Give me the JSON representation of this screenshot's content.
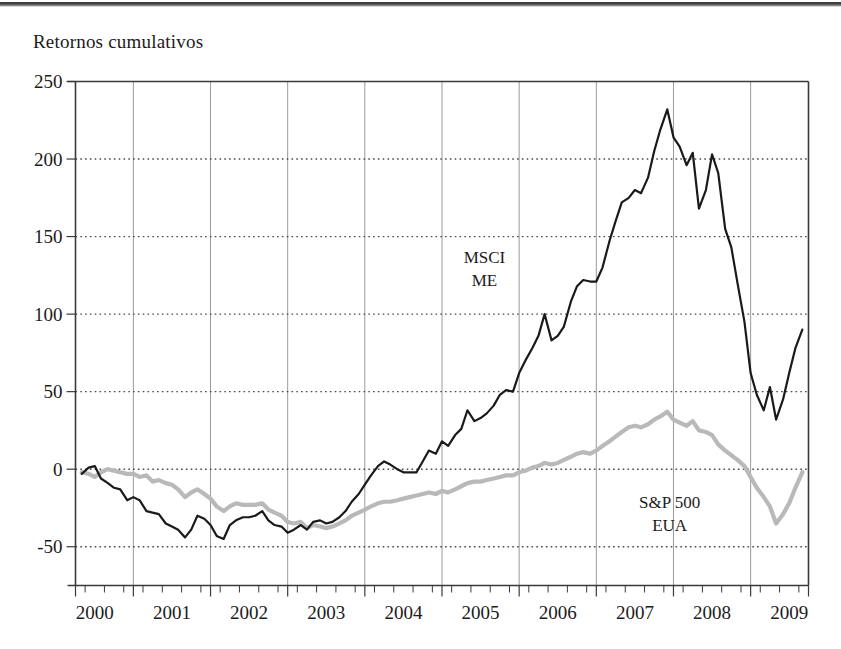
{
  "title": "Retornos cumulativos",
  "chart_data": {
    "type": "line",
    "title": "Retornos cumulativos",
    "xlabel": "",
    "ylabel": "",
    "ylim": [
      -75,
      250
    ],
    "xlim": [
      1999.75,
      2009.25
    ],
    "grid": "major vertical solid, horizontal dotted at y ticks",
    "legend_position": "inline annotations on plot",
    "y_ticks": [
      250,
      200,
      150,
      100,
      50,
      0,
      -50
    ],
    "x_ticks": [
      2000,
      2001,
      2002,
      2003,
      2004,
      2005,
      2006,
      2007,
      2008,
      2009
    ],
    "x_minor_ticks_per_year": 4,
    "annotations": [
      {
        "text_line1": "MSCI",
        "text_line2": "ME",
        "x": 2005.05,
        "y": 133
      },
      {
        "text_line1": "S&P 500",
        "text_line2": "EUA",
        "x": 2007.45,
        "y": -25
      }
    ],
    "series": [
      {
        "name": "MSCI ME",
        "color": "#1a1a1a",
        "width": 2.2,
        "x": [
          1999.83,
          1999.92,
          2000.0,
          2000.08,
          2000.17,
          2000.25,
          2000.33,
          2000.42,
          2000.5,
          2000.58,
          2000.67,
          2000.75,
          2000.83,
          2000.92,
          2001.0,
          2001.08,
          2001.17,
          2001.25,
          2001.33,
          2001.42,
          2001.5,
          2001.58,
          2001.67,
          2001.75,
          2001.83,
          2001.92,
          2002.0,
          2002.08,
          2002.17,
          2002.25,
          2002.33,
          2002.42,
          2002.5,
          2002.58,
          2002.67,
          2002.75,
          2002.83,
          2002.92,
          2003.0,
          2003.08,
          2003.17,
          2003.25,
          2003.33,
          2003.42,
          2003.5,
          2003.58,
          2003.67,
          2003.75,
          2003.83,
          2003.92,
          2004.0,
          2004.08,
          2004.17,
          2004.25,
          2004.33,
          2004.42,
          2004.5,
          2004.58,
          2004.67,
          2004.75,
          2004.83,
          2004.92,
          2005.0,
          2005.08,
          2005.17,
          2005.25,
          2005.33,
          2005.42,
          2005.5,
          2005.58,
          2005.67,
          2005.75,
          2005.83,
          2005.92,
          2006.0,
          2006.08,
          2006.17,
          2006.25,
          2006.33,
          2006.42,
          2006.5,
          2006.58,
          2006.67,
          2006.75,
          2006.83,
          2006.92,
          2007.0,
          2007.08,
          2007.17,
          2007.25,
          2007.33,
          2007.42,
          2007.5,
          2007.58,
          2007.67,
          2007.75,
          2007.83,
          2007.92,
          2008.0,
          2008.08,
          2008.17,
          2008.25,
          2008.33,
          2008.42,
          2008.5,
          2008.58,
          2008.67,
          2008.75,
          2008.83,
          2008.92,
          2009.0,
          2009.08,
          2009.17
        ],
        "y": [
          -3,
          1,
          2,
          -6,
          -9,
          -12,
          -13,
          -20,
          -18,
          -20,
          -27,
          -28,
          -29,
          -35,
          -37,
          -39,
          -44,
          -39,
          -30,
          -32,
          -36,
          -43,
          -45,
          -36,
          -33,
          -31,
          -31,
          -30,
          -27,
          -33,
          -36,
          -37,
          -41,
          -39,
          -36,
          -39,
          -34,
          -33,
          -35,
          -34,
          -31,
          -27,
          -21,
          -16,
          -10,
          -4,
          2,
          5,
          3,
          0,
          -2,
          -2,
          -2,
          5,
          12,
          10,
          18,
          15,
          22,
          26,
          38,
          31,
          33,
          36,
          41,
          48,
          51,
          50,
          62,
          70,
          78,
          86,
          100,
          83,
          86,
          92,
          108,
          118,
          122,
          121,
          121,
          130,
          147,
          160,
          172,
          175,
          180,
          178,
          188,
          205,
          219,
          232,
          214,
          208,
          196,
          204,
          168,
          180,
          203,
          191,
          155,
          143,
          120,
          95,
          62,
          48,
          38,
          53,
          32,
          45,
          62,
          78,
          90
        ]
      },
      {
        "name": "S&P 500 EUA",
        "color": "#b9b9b9",
        "width": 4.2,
        "x": [
          1999.83,
          1999.92,
          2000.0,
          2000.08,
          2000.17,
          2000.25,
          2000.33,
          2000.42,
          2000.5,
          2000.58,
          2000.67,
          2000.75,
          2000.83,
          2000.92,
          2001.0,
          2001.08,
          2001.17,
          2001.25,
          2001.33,
          2001.42,
          2001.5,
          2001.58,
          2001.67,
          2001.75,
          2001.83,
          2001.92,
          2002.0,
          2002.08,
          2002.17,
          2002.25,
          2002.33,
          2002.42,
          2002.5,
          2002.58,
          2002.67,
          2002.75,
          2002.83,
          2002.92,
          2003.0,
          2003.08,
          2003.17,
          2003.25,
          2003.33,
          2003.42,
          2003.5,
          2003.58,
          2003.67,
          2003.75,
          2003.83,
          2003.92,
          2004.0,
          2004.08,
          2004.17,
          2004.25,
          2004.33,
          2004.42,
          2004.5,
          2004.58,
          2004.67,
          2004.75,
          2004.83,
          2004.92,
          2005.0,
          2005.08,
          2005.17,
          2005.25,
          2005.33,
          2005.42,
          2005.5,
          2005.58,
          2005.67,
          2005.75,
          2005.83,
          2005.92,
          2006.0,
          2006.08,
          2006.17,
          2006.25,
          2006.33,
          2006.42,
          2006.5,
          2006.58,
          2006.67,
          2006.75,
          2006.83,
          2006.92,
          2007.0,
          2007.08,
          2007.17,
          2007.25,
          2007.33,
          2007.42,
          2007.5,
          2007.58,
          2007.67,
          2007.75,
          2007.83,
          2007.92,
          2008.0,
          2008.08,
          2008.17,
          2008.25,
          2008.33,
          2008.42,
          2008.5,
          2008.58,
          2008.67,
          2008.75,
          2008.83,
          2008.92,
          2009.0,
          2009.08,
          2009.17
        ],
        "y": [
          -2,
          -3,
          -5,
          -2,
          0,
          -1,
          -2,
          -3,
          -3,
          -5,
          -4,
          -8,
          -7,
          -9,
          -10,
          -13,
          -18,
          -15,
          -13,
          -16,
          -19,
          -24,
          -27,
          -24,
          -22,
          -23,
          -23,
          -23,
          -22,
          -26,
          -28,
          -30,
          -34,
          -35,
          -34,
          -38,
          -36,
          -37,
          -38,
          -37,
          -35,
          -33,
          -30,
          -28,
          -26,
          -24,
          -22,
          -21,
          -21,
          -20,
          -19,
          -18,
          -17,
          -16,
          -15,
          -16,
          -14,
          -15,
          -13,
          -11,
          -9,
          -8,
          -8,
          -7,
          -6,
          -5,
          -4,
          -4,
          -2,
          -1,
          1,
          2,
          4,
          3,
          4,
          6,
          8,
          10,
          11,
          10,
          12,
          15,
          18,
          21,
          24,
          27,
          28,
          27,
          29,
          32,
          34,
          37,
          32,
          30,
          28,
          31,
          25,
          24,
          22,
          16,
          12,
          9,
          6,
          2,
          -5,
          -12,
          -18,
          -24,
          -35,
          -29,
          -22,
          -12,
          -2
        ]
      }
    ]
  },
  "axes": {
    "y_tick_labels": [
      "250",
      "200",
      "150",
      "100",
      "50",
      "0",
      "-50"
    ],
    "x_tick_labels": [
      "2000",
      "2001",
      "2002",
      "2003",
      "2004",
      "2005",
      "2006",
      "2007",
      "2008",
      "2009"
    ]
  },
  "annotation_msci": {
    "line1": "MSCI",
    "line2": "ME"
  },
  "annotation_sp500": {
    "line1": "S&P 500",
    "line2": "EUA"
  },
  "colors": {
    "msci_line": "#1a1a1a",
    "sp500_line": "#b9b9b9",
    "axis": "#3a3a3a",
    "gridline": "#9a9a9a",
    "dotted_grid": "#4a4a4a"
  }
}
